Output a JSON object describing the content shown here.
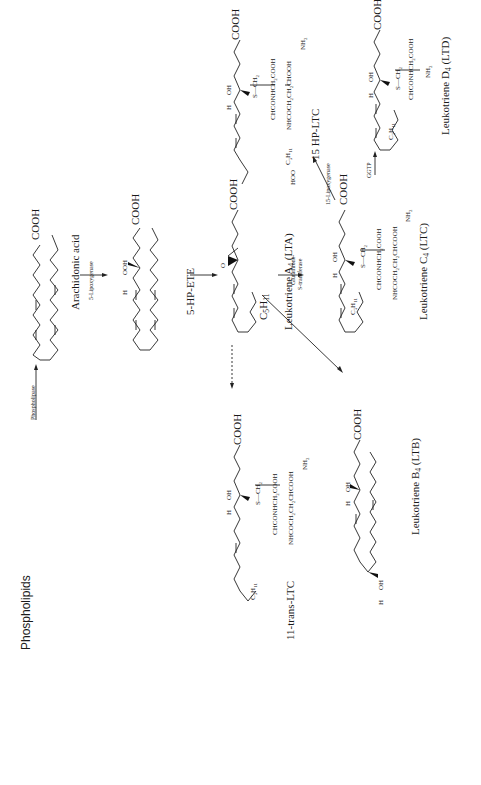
{
  "figure": {
    "type": "biochemical pathway",
    "topic": "Leukotriene biosynthesis from arachidonic acid"
  },
  "compounds": {
    "phospholipids": "Phospholipids",
    "arachidonic_acid": "Arachidonic acid",
    "hpete": "5-HP-ETE",
    "lta": "Leukotriene A4 (LTA)",
    "ltb": "Leukotriene B4 (LTB)",
    "ltc": "Leukotriene C4 (LTC)",
    "ltd": "Leukotriene D4 (LTD)",
    "hp_ltc": "15 HP-LTC",
    "trans_ltc": "11-trans-LTC"
  },
  "enzymes": {
    "phospholipase": "Phospholipase",
    "lipoxygenase_5": "5-Lipoxygenase",
    "gst_line1": "Glutathione-",
    "gst_line2": "S-transferase",
    "lipoxygenase_15": "15-Lipoxygenase",
    "ggtp": "GGTP"
  },
  "groups": {
    "cooh": "COOH",
    "ooh": "OOH",
    "oh": "OH",
    "h": "H",
    "o": "O",
    "hoo": "HOO",
    "c5h11": "C5H11",
    "s_ch2": "S—CH2",
    "chconhch2cooh": "CHCONHCH2COOH",
    "nhcoch2ch2chcooh": "NHCOCH2CH2CHCOOH",
    "nhcoch2ch2chooh": "NHCOCH2CH2CHOOH",
    "nh2": "NH2"
  },
  "arrows": [
    {
      "from": "Phospholipids",
      "to": "Arachidonic acid",
      "enzyme": "Phospholipase"
    },
    {
      "from": "Arachidonic acid",
      "to": "5-HP-ETE",
      "enzyme": "5-Lipoxygenase"
    },
    {
      "from": "5-HP-ETE",
      "to": "Leukotriene A4 (LTA)",
      "enzyme": ""
    },
    {
      "from": "Leukotriene A4 (LTA)",
      "to": "Leukotriene C4 (LTC)",
      "enzyme": "Glutathione-S-transferase"
    },
    {
      "from": "Leukotriene A4 (LTA)",
      "to": "Leukotriene B4 (LTB)",
      "enzyme": ""
    },
    {
      "from": "Leukotriene A4 (LTA)",
      "to": "11-trans-LTC",
      "enzyme": "",
      "style": "dashed"
    },
    {
      "from": "Leukotriene C4 (LTC)",
      "to": "15 HP-LTC",
      "enzyme": "15-Lipoxygenase"
    },
    {
      "from": "Leukotriene C4 (LTC)",
      "to": "Leukotriene D4 (LTD)",
      "enzyme": "GGTP"
    }
  ]
}
